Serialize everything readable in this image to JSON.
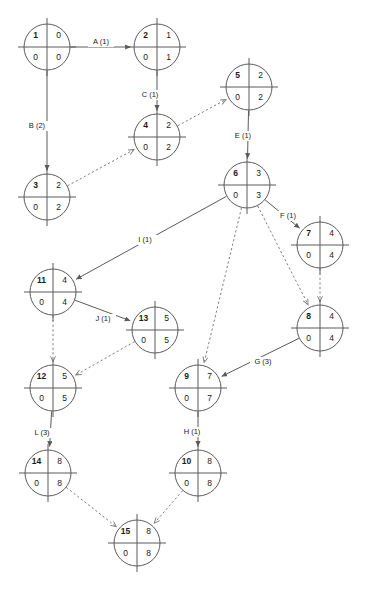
{
  "diagram": {
    "type": "activity-on-node network",
    "canvas": {
      "width": 367,
      "height": 592
    },
    "node_radius": 23,
    "colors": {
      "background": "#ffffff",
      "node_stroke": "#5a5a5a",
      "solid_edge": "#5a5a5a",
      "dashed_edge": "#7d7d7d",
      "text": "#1a1a1a"
    },
    "quadrant_meaning": {
      "top_left": "node id",
      "top_right": "early value",
      "bottom_left": "float",
      "bottom_right": "late value"
    },
    "nodes": [
      {
        "id": "1",
        "top_left": "1",
        "top_right": "0",
        "bottom_left": "0",
        "bottom_right": "0",
        "cx": 47,
        "cy": 47
      },
      {
        "id": "2",
        "top_left": "2",
        "top_right": "1",
        "bottom_left": "0",
        "bottom_right": "1",
        "cx": 157,
        "cy": 47
      },
      {
        "id": "3",
        "top_left": "3",
        "top_right": "2",
        "bottom_left": "0",
        "bottom_right": "2",
        "cx": 47,
        "cy": 197
      },
      {
        "id": "4",
        "top_left": "4",
        "top_right": "2",
        "bottom_left": "0",
        "bottom_right": "2",
        "cx": 157,
        "cy": 137
      },
      {
        "id": "5",
        "top_left": "5",
        "top_right": "2",
        "bottom_left": "0",
        "bottom_right": "2",
        "cx": 249,
        "cy": 87
      },
      {
        "id": "6",
        "top_left": "6",
        "top_right": "3",
        "bottom_left": "0",
        "bottom_right": "3",
        "cx": 247,
        "cy": 185
      },
      {
        "id": "7",
        "top_left": "7",
        "top_right": "4",
        "bottom_left": "0",
        "bottom_right": "4",
        "cx": 320,
        "cy": 245
      },
      {
        "id": "8",
        "top_left": "8",
        "top_right": "4",
        "bottom_left": "0",
        "bottom_right": "4",
        "cx": 320,
        "cy": 328
      },
      {
        "id": "9",
        "top_left": "9",
        "top_right": "7",
        "bottom_left": "0",
        "bottom_right": "7",
        "cx": 198,
        "cy": 388
      },
      {
        "id": "10",
        "top_left": "10",
        "top_right": "8",
        "bottom_left": "0",
        "bottom_right": "8",
        "cx": 198,
        "cy": 473
      },
      {
        "id": "11",
        "top_left": "11",
        "top_right": "4",
        "bottom_left": "0",
        "bottom_right": "4",
        "cx": 53,
        "cy": 292
      },
      {
        "id": "12",
        "top_left": "12",
        "top_right": "5",
        "bottom_left": "0",
        "bottom_right": "5",
        "cx": 53,
        "cy": 388
      },
      {
        "id": "13",
        "top_left": "13",
        "top_right": "5",
        "bottom_left": "0",
        "bottom_right": "5",
        "cx": 155,
        "cy": 330
      },
      {
        "id": "14",
        "top_left": "14",
        "top_right": "8",
        "bottom_left": "0",
        "bottom_right": "8",
        "cx": 48,
        "cy": 473
      },
      {
        "id": "15",
        "top_left": "15",
        "top_right": "8",
        "bottom_left": "0",
        "bottom_right": "8",
        "cx": 137,
        "cy": 543
      }
    ],
    "edges": [
      {
        "name": "edge-a",
        "from": "1",
        "to": "2",
        "label": "A (1)",
        "style": "solid",
        "label_x": 101,
        "label_y": 42
      },
      {
        "name": "edge-b",
        "from": "1",
        "to": "3",
        "label": "B (2)",
        "style": "solid",
        "label_x": 37,
        "label_y": 126
      },
      {
        "name": "edge-c",
        "from": "2",
        "to": "4",
        "label": "C (1)",
        "style": "solid",
        "label_x": 150,
        "label_y": 95
      },
      {
        "name": "edge-3-4",
        "from": "3",
        "to": "4",
        "label": "",
        "style": "dashed",
        "label_x": 0,
        "label_y": 0
      },
      {
        "name": "edge-4-5",
        "from": "4",
        "to": "5",
        "label": "",
        "style": "dashed",
        "label_x": 0,
        "label_y": 0
      },
      {
        "name": "edge-e",
        "from": "5",
        "to": "6",
        "label": "E (1)",
        "style": "solid",
        "label_x": 243,
        "label_y": 136
      },
      {
        "name": "edge-f",
        "from": "6",
        "to": "7",
        "label": "F (1)",
        "style": "solid",
        "label_x": 288,
        "label_y": 216
      },
      {
        "name": "edge-i",
        "from": "6",
        "to": "11",
        "label": "I (1)",
        "style": "solid",
        "label_x": 145,
        "label_y": 240
      },
      {
        "name": "edge-6-9",
        "from": "6",
        "to": "9",
        "label": "",
        "style": "dashed",
        "label_x": 0,
        "label_y": 0
      },
      {
        "name": "edge-6-8",
        "from": "6",
        "to": "8",
        "label": "",
        "style": "dashed",
        "label_x": 0,
        "label_y": 0
      },
      {
        "name": "edge-7-8",
        "from": "7",
        "to": "8",
        "label": "",
        "style": "dashed",
        "label_x": 0,
        "label_y": 0
      },
      {
        "name": "edge-g",
        "from": "8",
        "to": "9",
        "label": "G (3)",
        "style": "solid",
        "label_x": 263,
        "label_y": 362
      },
      {
        "name": "edge-h",
        "from": "9",
        "to": "10",
        "label": "H (1)",
        "style": "solid",
        "label_x": 192,
        "label_y": 432
      },
      {
        "name": "edge-j",
        "from": "11",
        "to": "13",
        "label": "J (1)",
        "style": "solid",
        "label_x": 103,
        "label_y": 319
      },
      {
        "name": "edge-11-12",
        "from": "11",
        "to": "12",
        "label": "",
        "style": "dashed",
        "label_x": 0,
        "label_y": 0
      },
      {
        "name": "edge-13-12",
        "from": "13",
        "to": "12",
        "label": "",
        "style": "dashed",
        "label_x": 0,
        "label_y": 0
      },
      {
        "name": "edge-l",
        "from": "12",
        "to": "14",
        "label": "L (3)",
        "style": "solid",
        "label_x": 42,
        "label_y": 433
      },
      {
        "name": "edge-14-15",
        "from": "14",
        "to": "15",
        "label": "",
        "style": "dashed",
        "label_x": 0,
        "label_y": 0
      },
      {
        "name": "edge-10-15",
        "from": "10",
        "to": "15",
        "label": "",
        "style": "dashed",
        "label_x": 0,
        "label_y": 0
      }
    ]
  }
}
